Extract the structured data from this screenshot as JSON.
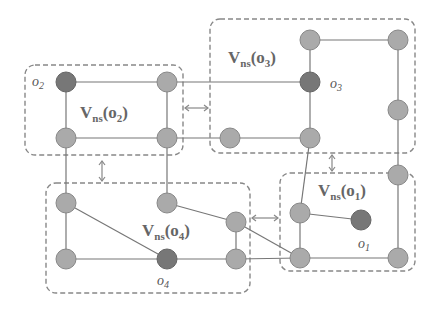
{
  "diagram": {
    "type": "graph-with-regions",
    "regions": [
      {
        "id": "o2",
        "label_main": "V",
        "label_sub": "ns",
        "label_arg": "(o",
        "label_arg_sub": "2",
        "label_close": ")"
      },
      {
        "id": "o3",
        "label_main": "V",
        "label_sub": "ns",
        "label_arg": "(o",
        "label_arg_sub": "3",
        "label_close": ")"
      },
      {
        "id": "o1",
        "label_main": "V",
        "label_sub": "ns",
        "label_arg": "(o",
        "label_arg_sub": "1",
        "label_close": ")"
      },
      {
        "id": "o4",
        "label_main": "V",
        "label_sub": "ns",
        "label_arg": "(o",
        "label_arg_sub": "4",
        "label_close": ")"
      }
    ],
    "objects": [
      {
        "id": "o1",
        "label": "o",
        "sub": "1"
      },
      {
        "id": "o2",
        "label": "o",
        "sub": "2"
      },
      {
        "id": "o3",
        "label": "o",
        "sub": "3"
      },
      {
        "id": "o4",
        "label": "o",
        "sub": "4"
      }
    ],
    "colors": {
      "node": "#aaaaaa",
      "object_node": "#777777",
      "edge": "#777777",
      "region_border": "#888888"
    }
  }
}
